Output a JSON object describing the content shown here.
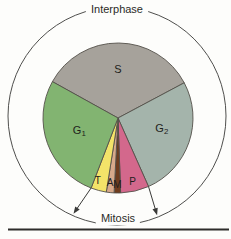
{
  "figure": {
    "interphase_label": "Interphase",
    "mitosis_label": "Mitosis"
  },
  "chart_data": {
    "type": "pie",
    "legend_position": "none",
    "grid": false,
    "annotations": [
      "Interphase",
      "Mitosis"
    ],
    "outer_ring_label_top": "Interphase",
    "outer_ring_label_bottom": "Mitosis",
    "geometry": {
      "pie_cx": 118,
      "pie_cy": 118,
      "pie_r": 75,
      "ring_cx": 117,
      "ring_cy": 116,
      "ring_r": 109
    },
    "colors": {
      "slice_stroke": "#54504a",
      "ring_stroke": "#4f4f4d",
      "arrow": "#3a3a38",
      "label": "#1e1e1c",
      "background": "#fdfdfb",
      "rule": "#2e2d2b"
    },
    "segments": [
      {
        "name": "S",
        "text": "S",
        "sub": "",
        "start_deg": 299,
        "sweep_deg": 123,
        "percent": 34.2,
        "color": "#a6a29b",
        "label_deg": 0,
        "label_r_frac": 0.66,
        "font_size": 11
      },
      {
        "name": "G2",
        "text": "G",
        "sub": "2",
        "start_deg": 62,
        "sweep_deg": 94,
        "percent": 26.1,
        "color": "#a4b4ab",
        "label_deg": 103,
        "label_r_frac": 0.6,
        "font_size": 11
      },
      {
        "name": "P",
        "text": "P",
        "sub": "",
        "start_deg": 156,
        "sweep_deg": 22,
        "percent": 6.1,
        "color": "#d3688c",
        "label_deg": 167,
        "label_r_frac": 0.86,
        "font_size": 10
      },
      {
        "name": "M",
        "text": "M",
        "sub": "",
        "start_deg": 178,
        "sweep_deg": 5,
        "percent": 1.4,
        "color": "#6f3c1e",
        "label_deg": 180.5,
        "label_r_frac": 0.88,
        "font_size": 10
      },
      {
        "name": "A",
        "text": "A",
        "sub": "",
        "start_deg": 183,
        "sweep_deg": 6,
        "percent": 1.7,
        "color": "#d7a98b",
        "label_deg": 187,
        "label_r_frac": 0.86,
        "font_size": 10
      },
      {
        "name": "T",
        "text": "T",
        "sub": "",
        "start_deg": 189,
        "sweep_deg": 12,
        "percent": 3.3,
        "color": "#f3e369",
        "label_deg": 198,
        "label_r_frac": 0.87,
        "font_size": 10
      },
      {
        "name": "G1",
        "text": "G",
        "sub": "1",
        "start_deg": 201,
        "sweep_deg": 98,
        "percent": 27.2,
        "color": "#82b471",
        "label_deg": 253,
        "label_r_frac": 0.54,
        "font_size": 11
      }
    ],
    "groups": [
      {
        "label": "Interphase",
        "members": [
          "G1",
          "S",
          "G2"
        ]
      },
      {
        "label": "Mitosis",
        "members": [
          "T",
          "A",
          "M",
          "P"
        ]
      }
    ],
    "mitosis_arrows": [
      {
        "rim_deg": 201,
        "tip_deg": 204
      },
      {
        "rim_deg": 156,
        "tip_deg": 158
      }
    ]
  }
}
